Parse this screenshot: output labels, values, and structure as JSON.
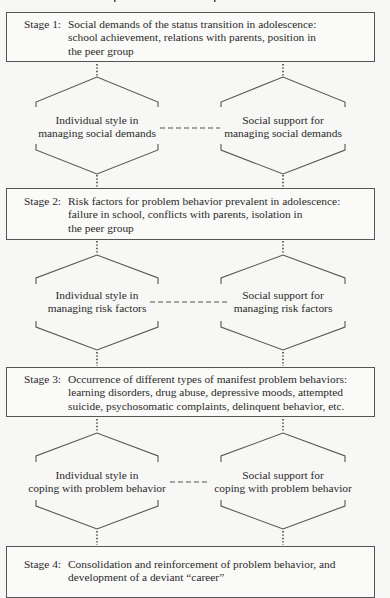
{
  "diagram": {
    "stages": [
      {
        "label": "Stage 1:",
        "text": "Social demands of the status transition in adolescence:\nschool achievement, relations with parents, position in\nthe peer group"
      },
      {
        "label": "Stage 2:",
        "text": "Risk factors for problem behavior prevalent in adolescence:\nfailure in school, conflicts with parents, isolation in\nthe peer group"
      },
      {
        "label": "Stage 3:",
        "text": "Occurrence of different types of manifest problem behaviors:\nlearning disorders, drug abuse, depressive moods, attempted\nsuicide, psychosomatic complaints, delinquent behavior, etc."
      },
      {
        "label": "Stage 4:",
        "text": "Consolidation and reinforcement of problem behavior, and\ndevelopment of a deviant “career”"
      }
    ],
    "moderators": [
      {
        "left": "Individual style in\nmanaging social demands",
        "right": "Social support for\nmanaging social demands"
      },
      {
        "left": "Individual style in\nmanaging risk factors",
        "right": "Social support for\nmanaging risk factors"
      },
      {
        "left": "Individual style in\ncoping with problem behavior",
        "right": "Social support for\ncoping with problem behavior"
      }
    ],
    "colors": {
      "line": "#555555",
      "text": "#2a2a2a",
      "background": "#f7f7f5"
    }
  }
}
